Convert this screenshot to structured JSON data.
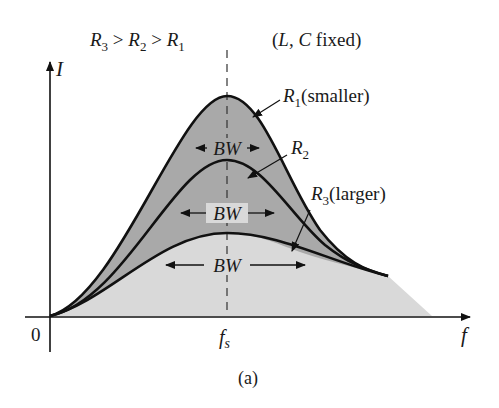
{
  "figure": {
    "condition": {
      "r3": "R",
      "r3_sub": "3",
      "gt1": " > ",
      "r2": "R",
      "r2_sub": "2",
      "gt2": " > ",
      "r1": "R",
      "r1_sub": "1"
    },
    "fixed_note": {
      "open": "(",
      "l": "L",
      "comma": ", ",
      "c": "C",
      "rest": " fixed)"
    },
    "y_axis_label": "I",
    "x_axis_label": "f",
    "origin_label": "0",
    "resonance_label": {
      "main": "f",
      "sub": "s"
    },
    "caption": "(a)",
    "curves": [
      {
        "id": "R1",
        "label_main": "R",
        "label_sub": "1",
        "label_suffix": "(smaller)",
        "bw_label": "BW"
      },
      {
        "id": "R2",
        "label_main": "R",
        "label_sub": "2",
        "label_suffix": "",
        "bw_label": "BW"
      },
      {
        "id": "R3",
        "label_main": "R",
        "label_sub": "3",
        "label_suffix": "(larger)",
        "bw_label": "BW"
      }
    ],
    "colors": {
      "line": "#111111",
      "fill_dark": "#a9a9a9",
      "fill_light": "#d9d9d9",
      "background": "#ffffff"
    }
  }
}
